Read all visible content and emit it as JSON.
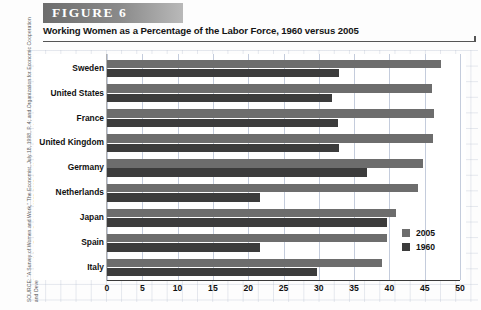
{
  "figure": {
    "banner_label": "FIGURE  6",
    "title": "Working Women as a Percentage of the Labor Force, 1960 versus 2005",
    "source": "SOURCE: \"A Survey of Women and Work,\" The Economist, July 18, 1998, P. 4; and Organization for Economic Cooperation and Development, Labor Force Statistics, 1985–2005, http://www.sourceoecd.org"
  },
  "colors": {
    "series_2005": "#6d6d6d",
    "series_1960": "#3c3c3c",
    "banner": "#8a8a8a",
    "grid": "#c4ccdc"
  },
  "chart_data": {
    "type": "bar",
    "orientation": "horizontal",
    "title": "Working Women as a Percentage of the Labor Force, 1960 versus 2005",
    "xlabel": "",
    "ylabel": "",
    "xlim": [
      0,
      50
    ],
    "xticks": [
      0,
      5,
      10,
      15,
      20,
      25,
      30,
      35,
      40,
      45,
      50
    ],
    "grid": true,
    "legend_position": "bottom-right",
    "categories": [
      "Sweden",
      "United States",
      "France",
      "United Kingdom",
      "Germany",
      "Netherlands",
      "Japan",
      "Spain",
      "Italy"
    ],
    "series": [
      {
        "name": "2005",
        "color": "#6d6d6d",
        "values": [
          47.3,
          46.0,
          46.3,
          46.2,
          44.8,
          44.0,
          41.0,
          39.7,
          38.9
        ]
      },
      {
        "name": "1960",
        "color": "#3c3c3c",
        "values": [
          32.9,
          31.8,
          32.7,
          32.9,
          36.8,
          21.7,
          39.7,
          21.7,
          29.7
        ]
      }
    ]
  }
}
